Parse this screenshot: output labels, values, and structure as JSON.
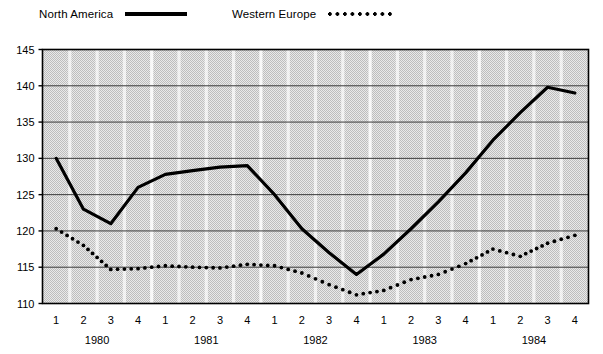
{
  "legend": {
    "items": [
      {
        "label": "North America",
        "style": "solid-line",
        "color": "#000000"
      },
      {
        "label": "Western Europe",
        "style": "dotted-line",
        "color": "#000000"
      }
    ]
  },
  "chart_data": {
    "type": "line",
    "title": "",
    "subtitle": "",
    "xlabel": "",
    "ylabel": "",
    "ylim": [
      110,
      145
    ],
    "yticks": [
      110,
      115,
      120,
      125,
      130,
      135,
      140,
      145
    ],
    "grid": "horizontal-gridlines-and-vertical-band-separators",
    "legend_position": "top-left",
    "x": [
      "1980 Q1",
      "1980 Q2",
      "1980 Q3",
      "1980 Q4",
      "1981 Q1",
      "1981 Q2",
      "1981 Q3",
      "1981 Q4",
      "1982 Q1",
      "1982 Q2",
      "1982 Q3",
      "1982 Q4",
      "1983 Q1",
      "1983 Q2",
      "1983 Q3",
      "1983 Q4",
      "1984 Q1",
      "1984 Q2",
      "1984 Q3",
      "1984 Q4"
    ],
    "quarter_labels": [
      "1",
      "2",
      "3",
      "4",
      "1",
      "2",
      "3",
      "4",
      "1",
      "2",
      "3",
      "4",
      "1",
      "2",
      "3",
      "4",
      "1",
      "2",
      "3",
      "4"
    ],
    "year_labels": [
      "1980",
      "1981",
      "1982",
      "1983",
      "1984"
    ],
    "series": [
      {
        "name": "North America",
        "style": "solid",
        "values": [
          130.0,
          123.0,
          121.0,
          126.0,
          127.8,
          128.3,
          128.8,
          129.0,
          125.0,
          120.3,
          117.0,
          114.0,
          116.8,
          120.3,
          124.0,
          128.0,
          132.5,
          136.3,
          139.8,
          139.0
        ]
      },
      {
        "name": "Western Europe",
        "style": "dotted",
        "values": [
          120.3,
          118.0,
          114.7,
          114.8,
          115.2,
          115.0,
          114.9,
          115.4,
          115.2,
          114.2,
          112.6,
          111.2,
          111.8,
          113.3,
          114.0,
          115.5,
          117.5,
          116.5,
          118.3,
          119.4
        ]
      }
    ]
  }
}
